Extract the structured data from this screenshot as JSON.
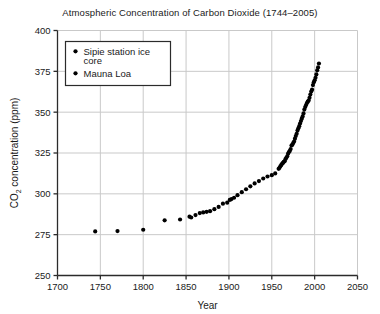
{
  "chart_data": {
    "type": "scatter",
    "title": "Atmospheric Concentration of Carbon Dioxide (1744–2005)",
    "xlabel": "Year",
    "ylabel": "CO2 concentration (ppm)",
    "ylabel_main": "CO",
    "ylabel_sub": "2",
    "ylabel_rest": " concentration (ppm)",
    "xlim": [
      1700,
      2050
    ],
    "ylim": [
      250,
      400
    ],
    "xticks": [
      1700,
      1750,
      1800,
      1850,
      1900,
      1950,
      2000,
      2050
    ],
    "yticks": [
      250,
      275,
      300,
      325,
      350,
      375,
      400
    ],
    "grid": true,
    "grid_color": "#c9c9c9",
    "marker_color": "#000000",
    "legend_position": "upper-left",
    "series": [
      {
        "name": "Sipie station ice core",
        "marker": "circle",
        "color": "#000000",
        "points": [
          [
            1744,
            277.0
          ],
          [
            1770,
            277.2
          ],
          [
            1800,
            278.0
          ],
          [
            1825,
            283.8
          ],
          [
            1843,
            284.3
          ],
          [
            1854,
            286.0
          ],
          [
            1856,
            285.5
          ],
          [
            1861,
            287.0
          ],
          [
            1866,
            288.2
          ],
          [
            1870,
            288.6
          ],
          [
            1874,
            289.0
          ],
          [
            1878,
            289.4
          ],
          [
            1883,
            290.6
          ],
          [
            1888,
            292.0
          ],
          [
            1893,
            294.0
          ],
          [
            1898,
            294.6
          ],
          [
            1901,
            296.3
          ],
          [
            1903,
            296.8
          ],
          [
            1906,
            297.6
          ],
          [
            1910,
            299.2
          ],
          [
            1915,
            301.0
          ],
          [
            1920,
            302.8
          ],
          [
            1925,
            304.6
          ],
          [
            1930,
            306.4
          ],
          [
            1935,
            307.8
          ],
          [
            1940,
            309.4
          ],
          [
            1945,
            310.6
          ],
          [
            1950,
            311.4
          ],
          [
            1954,
            312.5
          ]
        ]
      },
      {
        "name": "Mauna Loa",
        "marker": "circle",
        "color": "#000000",
        "points": [
          [
            1958,
            315.3
          ],
          [
            1959,
            315.9
          ],
          [
            1960,
            316.9
          ],
          [
            1961,
            317.6
          ],
          [
            1962,
            318.4
          ],
          [
            1963,
            318.9
          ],
          [
            1964,
            319.6
          ],
          [
            1965,
            320.0
          ],
          [
            1966,
            321.3
          ],
          [
            1967,
            322.1
          ],
          [
            1968,
            323.0
          ],
          [
            1969,
            324.6
          ],
          [
            1970,
            325.6
          ],
          [
            1971,
            326.3
          ],
          [
            1972,
            327.4
          ],
          [
            1973,
            329.6
          ],
          [
            1974,
            330.1
          ],
          [
            1975,
            331.1
          ],
          [
            1976,
            332.0
          ],
          [
            1977,
            333.8
          ],
          [
            1978,
            335.4
          ],
          [
            1979,
            336.8
          ],
          [
            1980,
            338.7
          ],
          [
            1981,
            340.1
          ],
          [
            1982,
            341.4
          ],
          [
            1983,
            343.0
          ],
          [
            1984,
            344.6
          ],
          [
            1985,
            346.0
          ],
          [
            1986,
            347.4
          ],
          [
            1987,
            349.2
          ],
          [
            1988,
            351.6
          ],
          [
            1989,
            353.1
          ],
          [
            1990,
            354.4
          ],
          [
            1991,
            355.6
          ],
          [
            1992,
            356.4
          ],
          [
            1993,
            357.1
          ],
          [
            1994,
            358.8
          ],
          [
            1995,
            360.8
          ],
          [
            1996,
            362.6
          ],
          [
            1997,
            363.8
          ],
          [
            1998,
            366.6
          ],
          [
            1999,
            368.3
          ],
          [
            2000,
            369.5
          ],
          [
            2001,
            371.0
          ],
          [
            2002,
            373.1
          ],
          [
            2003,
            375.6
          ],
          [
            2004,
            377.4
          ],
          [
            2005,
            379.8
          ]
        ]
      }
    ]
  },
  "legend": {
    "entries": [
      {
        "label_line1": "Sipie station ice",
        "label_line2": "core"
      },
      {
        "label_line1": "Mauna Loa",
        "label_line2": ""
      }
    ]
  }
}
